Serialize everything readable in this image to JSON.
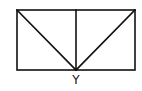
{
  "diagram": {
    "type": "geometric-figure",
    "points": {
      "bottom_midpoint": {
        "label": "Y"
      }
    },
    "colors": {
      "stroke": "#111111",
      "background": "#ffffff"
    }
  }
}
